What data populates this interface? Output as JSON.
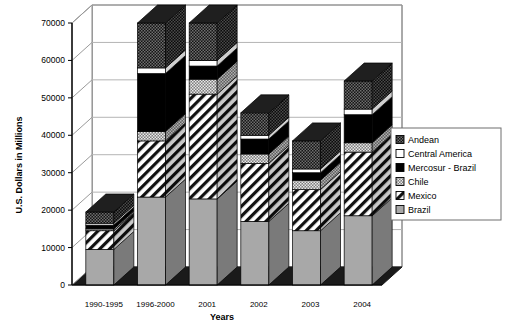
{
  "chart_data": {
    "type": "bar",
    "subtype": "stacked-3d-column",
    "title": "",
    "xlabel": "Years",
    "ylabel": "U.S. Dollars in Millions",
    "categories": [
      "1990-1995",
      "1996-2000",
      "2001",
      "2002",
      "2003",
      "2004"
    ],
    "ylim": [
      0,
      70000
    ],
    "yticks": [
      0,
      10000,
      20000,
      30000,
      40000,
      50000,
      60000,
      70000
    ],
    "ytick_labels": [
      "0",
      "10000",
      "20000",
      "30000",
      "40000",
      "50000",
      "60000",
      "70000"
    ],
    "grid": true,
    "legend_position": "right",
    "series": [
      {
        "name": "Brazil",
        "fill": "solid-gray",
        "color": "#a8a8a8",
        "values": [
          9500,
          23500,
          23000,
          17000,
          14500,
          18500
        ]
      },
      {
        "name": "Mexico",
        "fill": "diagonal-hatch",
        "color": "#ffffff",
        "values": [
          5000,
          15000,
          28000,
          15500,
          11000,
          17000
        ]
      },
      {
        "name": "Chile",
        "fill": "dotted-gray",
        "color": "#8f8f8f",
        "values": [
          500,
          2500,
          4000,
          2500,
          2500,
          2500
        ]
      },
      {
        "name": "Mercosur - Brazil",
        "fill": "solid-black",
        "color": "#000000",
        "values": [
          1000,
          15500,
          3500,
          4000,
          2000,
          7500
        ]
      },
      {
        "name": "Central America",
        "fill": "solid-white",
        "color": "#ffffff",
        "values": [
          500,
          1500,
          1500,
          1000,
          1000,
          1500
        ]
      },
      {
        "name": "Andean",
        "fill": "checker-dark",
        "color": "#2b2b2b",
        "values": [
          3000,
          12000,
          10000,
          6000,
          7500,
          7500
        ]
      }
    ],
    "totals": [
      19500,
      70000,
      70000,
      46000,
      38500,
      54500
    ],
    "legend_entries": [
      {
        "label": "Andean",
        "swatch": "checker-dark"
      },
      {
        "label": "Central America",
        "swatch": "solid-white"
      },
      {
        "label": "Mercosur - Brazil",
        "swatch": "solid-black"
      },
      {
        "label": "Chile",
        "swatch": "dotted-gray"
      },
      {
        "label": "Mexico",
        "swatch": "diagonal-hatch"
      },
      {
        "label": "Brazil",
        "swatch": "solid-gray"
      }
    ]
  },
  "colors": {
    "axis": "#000000",
    "grid": "#b4b4b4",
    "floor": "#1a1a1a",
    "wall": "#ffffff",
    "plot_border": "#555555"
  }
}
